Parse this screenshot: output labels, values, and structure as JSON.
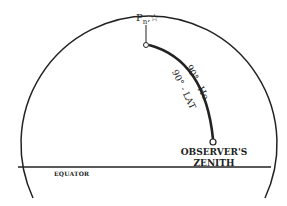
{
  "diagram": {
    "pole_label": "P",
    "pole_subscript": "n",
    "pole_star": "☆",
    "arc_label_outer": "90° - Ho",
    "arc_label_inner": "90° - LAT",
    "zenith_line1": "OBSERVER'S",
    "zenith_line2": "ZENITH",
    "equator_label": "EQUATOR",
    "colors": {
      "line": "#222222",
      "background": "#ffffff"
    }
  }
}
